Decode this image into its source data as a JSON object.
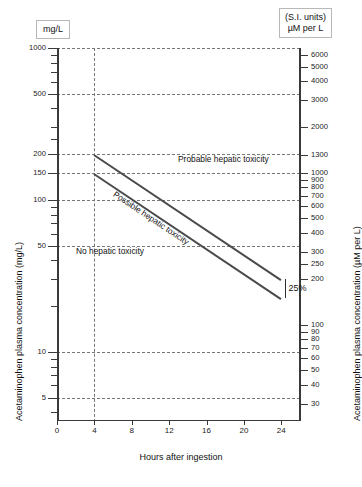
{
  "header": {
    "left_unit_label": "mg/L",
    "right_unit_line1": "(S.I. units)",
    "right_unit_line2": "µM per L"
  },
  "axes": {
    "left_title": "Acetaminophen plasma concentration (mg/L)",
    "right_title": "Acetaminophen plasma concentration (µM per L)",
    "x_title": "Hours after ingestion"
  },
  "annotations": {
    "probable": "Probable hepatic toxicity",
    "possible": "Possible hepatic toxicity",
    "none": "No hepatic toxicity",
    "percent": "25%"
  },
  "chart_data": {
    "type": "line",
    "xlabel": "Hours after ingestion",
    "ylabel": "Acetaminophen plasma concentration (mg/L)",
    "ylabel_right": "Acetaminophen plasma concentration (µM per L)",
    "xlim": [
      0,
      26
    ],
    "ylim": [
      3.5,
      1000
    ],
    "yscale": "log",
    "grid": true,
    "legend": "none",
    "x_ticks": [
      0,
      4,
      8,
      12,
      16,
      20,
      24
    ],
    "y_ticks_left": [
      1000,
      500,
      200,
      150,
      100,
      50,
      10,
      5
    ],
    "y_ticks_right": [
      6000,
      5000,
      4000,
      3000,
      2000,
      1300,
      1000,
      900,
      800,
      700,
      600,
      500,
      400,
      300,
      250,
      200,
      100,
      90,
      80,
      70,
      60,
      50,
      40,
      30,
      20,
      10
    ],
    "gridlines_y": [
      1000,
      500,
      200,
      150,
      100,
      50,
      10,
      5
    ],
    "gridlines_x": [
      4
    ],
    "series": [
      {
        "name": "Probable hepatic toxicity line",
        "x": [
          4,
          24
        ],
        "values": [
          200,
          30
        ],
        "units": "mg/L"
      },
      {
        "name": "Possible hepatic toxicity line (25% below)",
        "x": [
          4,
          24
        ],
        "values": [
          150,
          22.5
        ],
        "units": "mg/L"
      }
    ],
    "regions": [
      {
        "label": "Probable hepatic toxicity",
        "position": "above upper line"
      },
      {
        "label": "Possible hepatic toxicity",
        "position": "between lines"
      },
      {
        "label": "No hepatic toxicity",
        "position": "below lower line"
      }
    ],
    "annotations": [
      {
        "text": "25%",
        "meaning": "25% below probable toxicity line",
        "x": 24,
        "y": 26
      }
    ]
  }
}
